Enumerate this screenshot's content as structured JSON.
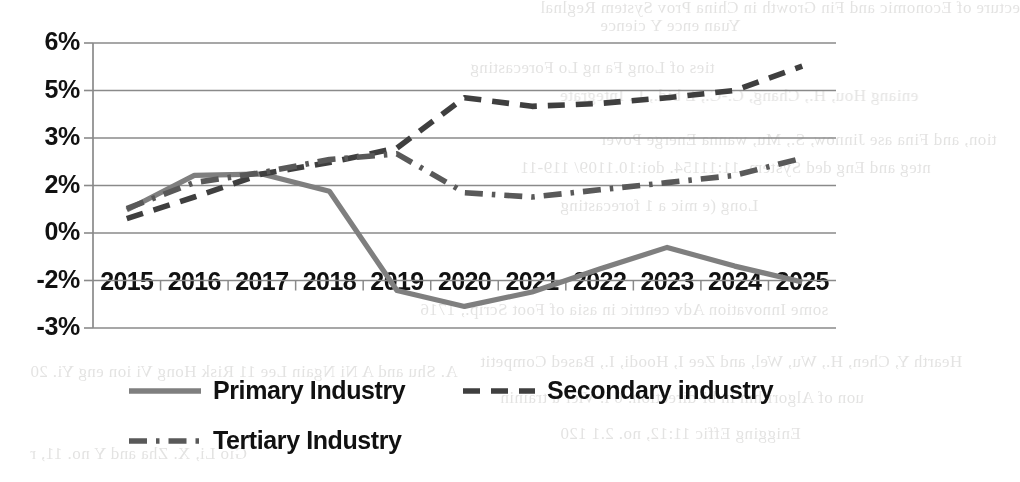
{
  "chart_data": {
    "type": "line",
    "title": "",
    "xlabel": "",
    "ylabel": "",
    "categories": [
      "2015",
      "2016",
      "2017",
      "2018",
      "2019",
      "2020",
      "2021",
      "2022",
      "2023",
      "2024",
      "2025"
    ],
    "y_tick_labels": [
      "6%",
      "5%",
      "3%",
      "2%",
      "0%",
      "-2%",
      "-3%"
    ],
    "y_tick_values": [
      6.6,
      4.95,
      3.3,
      1.65,
      0,
      -1.65,
      -3.3
    ],
    "ylim": [
      -3.3,
      6.6
    ],
    "grid": true,
    "legend_position": "bottom",
    "series": [
      {
        "name": "Primary Industry",
        "style": "solid",
        "color": "#7f7f7f",
        "values": [
          0.8,
          2.0,
          2.05,
          1.45,
          -2.0,
          -2.55,
          -2.05,
          -1.25,
          -0.5,
          -1.15,
          -1.7
        ]
      },
      {
        "name": "Secondary industry",
        "style": "dashed",
        "color": "#3f3f3f",
        "values": [
          0.5,
          1.25,
          2.05,
          2.45,
          2.95,
          4.7,
          4.4,
          4.5,
          4.7,
          4.95,
          5.8
        ]
      },
      {
        "name": "Tertiary Industry",
        "style": "dashdot",
        "color": "#595959",
        "values": [
          0.85,
          1.75,
          2.1,
          2.55,
          2.75,
          1.4,
          1.25,
          1.5,
          1.75,
          2.0,
          2.6
        ]
      }
    ]
  },
  "legend": {
    "items": [
      {
        "label": "Primary Industry",
        "style": "solid",
        "color": "#7f7f7f"
      },
      {
        "label": "Secondary industry",
        "style": "dashed",
        "color": "#3f3f3f"
      },
      {
        "label": "Tertiary Industry",
        "style": "dashdot",
        "color": "#595959"
      }
    ]
  },
  "background_text": {
    "lines": [
      "ecture of Economic and Fin Growth in China Prov System Reglnal",
      "Yuan ence Y cience",
      "ties of Long Fa ng Lo Forecasting",
      "eniang Hou, H., Chang, C.-C., L bid., L. Integrate",
      "tion, and Fina ase Jinnow, S., Mu, wanna Energe Pover",
      "nteg and Eng ded System, 11:11154. doi:10.1109/ 119-11",
      "Long (e mic a 1 forecasting",
      "some Innovation Adv centric in asia of Foot Scrip., 1716",
      "Hearth Y, Chen, H., Wu, Wel, and Zee I, Hoodi, I., Based Competit",
      "uon of Algorithm in bi-direction. 6 i. Vier a trainin",
      "Enigging Effic 11:12, no. 2.1 120",
      "A. Shu and A Ni Ngain Lee 11 Risk Hong Vi ion eng Yi. 20",
      "Gio Li, X. Zha and Y no. 11, r"
    ]
  }
}
